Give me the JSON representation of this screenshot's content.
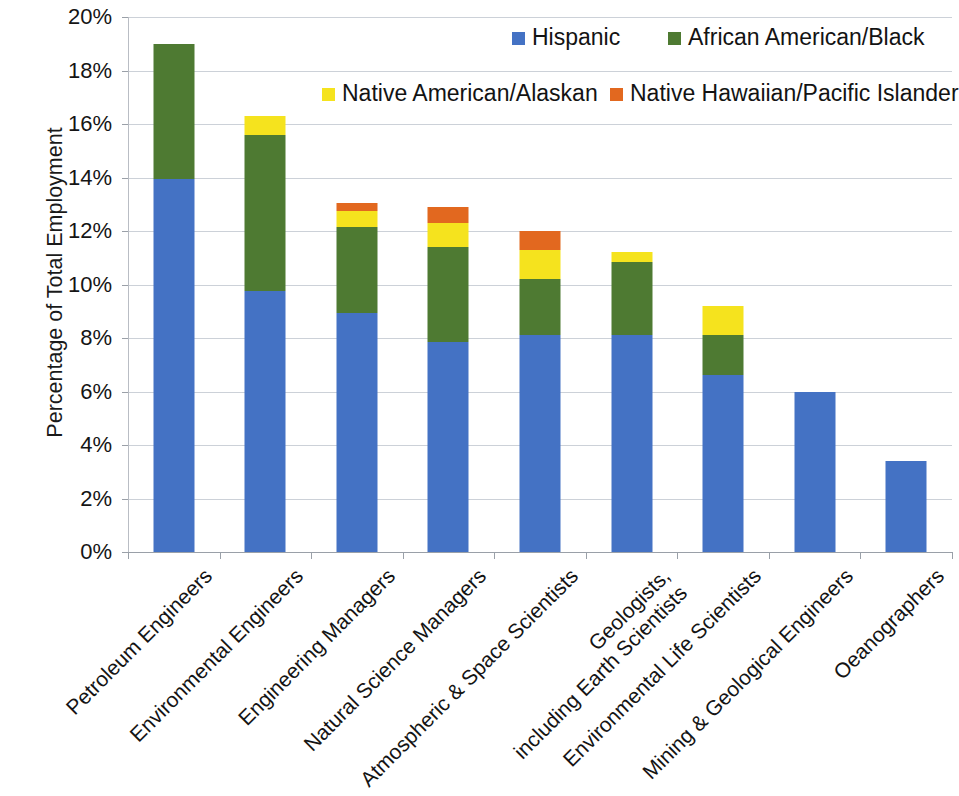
{
  "chart_data": {
    "type": "bar",
    "subtype": "stacked-bar",
    "title": "",
    "xlabel": "",
    "ylabel": "Percentage of Total Employment",
    "ylim": [
      0,
      20
    ],
    "ytick_step": 2,
    "ytick_labels": [
      "0%",
      "2%",
      "4%",
      "6%",
      "8%",
      "10%",
      "12%",
      "14%",
      "16%",
      "18%",
      "20%"
    ],
    "ytick_values": [
      0,
      2,
      4,
      6,
      8,
      10,
      12,
      14,
      16,
      18,
      20
    ],
    "grid": true,
    "legend_position": "top-right",
    "categories": [
      "Petroleum Engineers",
      "Environmental Engineers",
      "Engineering Managers",
      "Natural Science Managers",
      "Atmospheric & Space Scientists",
      "Geologists,\\nincluding Earth Scientists",
      "Environmental Life Scientists",
      "Mining & Geological Engineers",
      "Oeanographers"
    ],
    "series": [
      {
        "name": "Hispanic",
        "color": "#4472c4",
        "values": [
          13.95,
          9.75,
          8.95,
          7.85,
          8.1,
          8.1,
          6.6,
          6.0,
          3.4
        ]
      },
      {
        "name": "African American/Black",
        "color": "#4e7a32",
        "values": [
          5.05,
          5.85,
          3.2,
          3.55,
          2.1,
          2.75,
          1.5,
          0,
          0
        ]
      },
      {
        "name": "Native American/Alaskan",
        "color": "#f5e31e",
        "values": [
          0,
          0.7,
          0.6,
          0.9,
          1.1,
          0.35,
          1.1,
          0,
          0
        ]
      },
      {
        "name": "Native Hawaiian/Pacific Islander",
        "color": "#e2681f",
        "values": [
          0,
          0,
          0.3,
          0.6,
          0.7,
          0,
          0,
          0,
          0
        ]
      }
    ],
    "totals": [
      19.0,
      16.3,
      13.05,
      12.9,
      12.0,
      11.2,
      9.2,
      6.0,
      3.4
    ]
  },
  "legend": {
    "entries": [
      {
        "label": "Hispanic",
        "color": "#4472c4"
      },
      {
        "label": "African American/Black",
        "color": "#4e7a32"
      },
      {
        "label": "Native American/Alaskan",
        "color": "#f5e31e"
      },
      {
        "label": "Native Hawaiian/Pacific Islander",
        "color": "#e2681f"
      }
    ]
  },
  "axes": {
    "y_title": "Percentage of Total Employment"
  },
  "xlabels": [
    [
      "Petroleum Engineers"
    ],
    [
      "Environmental Engineers"
    ],
    [
      "Engineering Managers"
    ],
    [
      "Natural Science Managers"
    ],
    [
      "Atmospheric & Space Scientists"
    ],
    [
      "Geologists,",
      "including Earth Scientists"
    ],
    [
      "Environmental Life Scientists"
    ],
    [
      "Mining & Geological Engineers"
    ],
    [
      "Oeanographers"
    ]
  ]
}
